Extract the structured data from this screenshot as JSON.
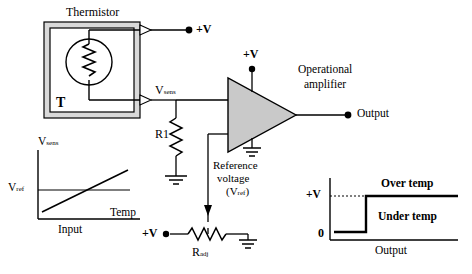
{
  "diagram": {
    "labels": {
      "thermistor": "Thermistor",
      "thermistor_symbol": "T",
      "supply_top": "+V",
      "supply_opamp": "+V",
      "supply_bottom": "+V",
      "v_sens_node": "V",
      "v_sens_sub": "sens",
      "r1": "R1",
      "opamp_title_line1": "Operational",
      "opamp_title_line2": "amplifier",
      "output": "Output",
      "reference_line1": "Reference",
      "reference_line2": "voltage",
      "reference_line3": "(V",
      "reference_line3_sub": "ref",
      "reference_line3_end": ")",
      "radj": "R",
      "radj_sub": "adj",
      "graph_left": {
        "y_axis": "V",
        "y_axis_sub": "sens",
        "vref": "V",
        "vref_sub": "ref",
        "x_axis_line1": "Temp",
        "x_axis_line2": "Input"
      },
      "graph_right": {
        "y_high": "+V",
        "y_zero": "0",
        "over_temp": "Over temp",
        "under_temp": "Under temp",
        "x_axis": "Output"
      }
    },
    "colors": {
      "ink": "#000000",
      "opamp_fill": "#c9c9c9",
      "thermistor_box_fill": "#d9d9d9",
      "background": "#ffffff"
    }
  }
}
